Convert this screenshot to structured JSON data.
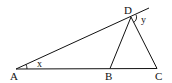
{
  "diagram": {
    "type": "geometry-triangle",
    "points": {
      "A": {
        "label": "A"
      },
      "B": {
        "label": "B"
      },
      "C": {
        "label": "C"
      },
      "D": {
        "label": "D"
      }
    },
    "angles": {
      "x": {
        "label": "x",
        "at": "A"
      },
      "y": {
        "label": "y",
        "at": "D"
      }
    },
    "segments": [
      "AC",
      "AD (extended beyond D)",
      "DB",
      "DC"
    ],
    "stroke_color": "#111111",
    "background": "#ffffff"
  }
}
